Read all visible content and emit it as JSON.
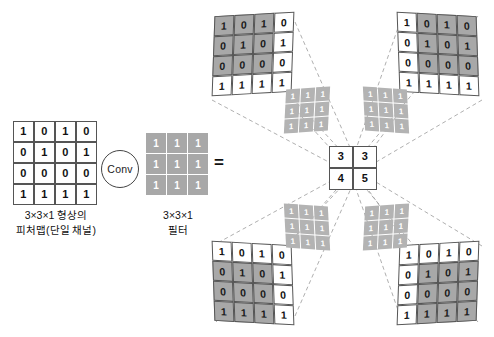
{
  "diagram": {
    "operator_label": "Conv",
    "equals_symbol": "=",
    "colors": {
      "shaded_cell": "#a8a8a8",
      "filter_cell": "#a8a8a8",
      "small_filter_cell": "#b3b3b3",
      "cell_border": "#555555",
      "background": "#ffffff",
      "dashed_line": "#999999"
    }
  },
  "input_feature_map": {
    "caption_line1": "3×3×1 형상의",
    "caption_line2": "피처맵(단일 채널)",
    "rows": [
      [
        "1",
        "0",
        "1",
        "0"
      ],
      [
        "0",
        "1",
        "0",
        "1"
      ],
      [
        "0",
        "0",
        "0",
        "0"
      ],
      [
        "1",
        "1",
        "1",
        "1"
      ]
    ]
  },
  "filter": {
    "caption_line1": "3×3×1",
    "caption_line2": "필터",
    "rows": [
      [
        "1",
        "1",
        "1"
      ],
      [
        "1",
        "1",
        "1"
      ],
      [
        "1",
        "1",
        "1"
      ]
    ]
  },
  "small_filters": {
    "rows": [
      [
        "1",
        "1",
        "1"
      ],
      [
        "1",
        "1",
        "1"
      ],
      [
        "1",
        "1",
        "1"
      ]
    ]
  },
  "sliding_windows": [
    {
      "position": "top-left",
      "window_origin_row": 0,
      "window_origin_col": 0,
      "output_cell": "3",
      "rows": [
        [
          "1",
          "0",
          "1",
          "0"
        ],
        [
          "0",
          "1",
          "0",
          "1"
        ],
        [
          "0",
          "0",
          "0",
          "0"
        ],
        [
          "1",
          "1",
          "1",
          "1"
        ]
      ],
      "shaded": [
        [
          true,
          true,
          true,
          false
        ],
        [
          true,
          true,
          true,
          false
        ],
        [
          true,
          true,
          true,
          false
        ],
        [
          false,
          false,
          false,
          false
        ]
      ]
    },
    {
      "position": "top-right",
      "window_origin_row": 0,
      "window_origin_col": 1,
      "output_cell": "3",
      "rows": [
        [
          "1",
          "0",
          "1",
          "0"
        ],
        [
          "0",
          "1",
          "0",
          "1"
        ],
        [
          "0",
          "0",
          "0",
          "0"
        ],
        [
          "1",
          "1",
          "1",
          "1"
        ]
      ],
      "shaded": [
        [
          false,
          true,
          true,
          true
        ],
        [
          false,
          true,
          true,
          true
        ],
        [
          false,
          true,
          true,
          true
        ],
        [
          false,
          false,
          false,
          false
        ]
      ]
    },
    {
      "position": "bottom-left",
      "window_origin_row": 1,
      "window_origin_col": 0,
      "output_cell": "4",
      "rows": [
        [
          "1",
          "0",
          "1",
          "0"
        ],
        [
          "0",
          "1",
          "0",
          "1"
        ],
        [
          "0",
          "0",
          "0",
          "0"
        ],
        [
          "1",
          "1",
          "1",
          "1"
        ]
      ],
      "shaded": [
        [
          false,
          false,
          false,
          false
        ],
        [
          true,
          true,
          true,
          false
        ],
        [
          true,
          true,
          true,
          false
        ],
        [
          true,
          true,
          true,
          false
        ]
      ]
    },
    {
      "position": "bottom-right",
      "window_origin_row": 1,
      "window_origin_col": 1,
      "output_cell": "5",
      "rows": [
        [
          "1",
          "0",
          "1",
          "0"
        ],
        [
          "0",
          "1",
          "0",
          "1"
        ],
        [
          "0",
          "0",
          "0",
          "0"
        ],
        [
          "1",
          "1",
          "1",
          "1"
        ]
      ],
      "shaded": [
        [
          false,
          false,
          false,
          false
        ],
        [
          false,
          true,
          true,
          true
        ],
        [
          false,
          true,
          true,
          true
        ],
        [
          false,
          true,
          true,
          true
        ]
      ]
    }
  ],
  "output_feature_map": {
    "rows": [
      [
        "3",
        "3"
      ],
      [
        "4",
        "5"
      ]
    ]
  }
}
